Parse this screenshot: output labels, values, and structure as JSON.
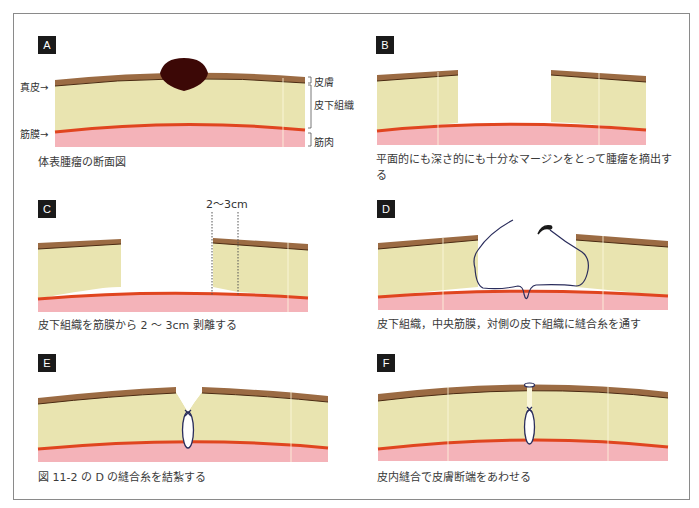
{
  "colors": {
    "skin": "#9b6b43",
    "dermis_line": "#4a2a12",
    "subcutaneous": "#e9e4b0",
    "fascia": "#e0451f",
    "muscle": "#f4b3b9",
    "tumor": "#3c0806",
    "suture": "#2a2d5c",
    "badge_bg": "#1a1a1a",
    "frame": "#8a8a8a"
  },
  "panels": [
    {
      "id": "A",
      "badge": "A",
      "caption": "体表腫瘤の断面図"
    },
    {
      "id": "B",
      "badge": "B",
      "caption": "平面的にも深さ的にも十分なマージンをとって腫瘤を摘出する"
    },
    {
      "id": "C",
      "badge": "C",
      "caption": "皮下組織を筋膜から 2 ～ 3cm 剥離する",
      "measure_label": "2～3cm"
    },
    {
      "id": "D",
      "badge": "D",
      "caption": "皮下組織，中央筋膜，対側の皮下組織に縫合糸を通す"
    },
    {
      "id": "E",
      "badge": "E",
      "caption": "図 11-2 の D の縫合糸を結紮する"
    },
    {
      "id": "F",
      "badge": "F",
      "caption": "皮内縫合で皮膚断端をあわせる"
    }
  ],
  "labels_left": {
    "dermis": "真皮→",
    "fascia": "筋膜→"
  },
  "labels_right": {
    "skin": "皮膚",
    "subcutaneous": "皮下組織",
    "muscle": "筋肉"
  }
}
